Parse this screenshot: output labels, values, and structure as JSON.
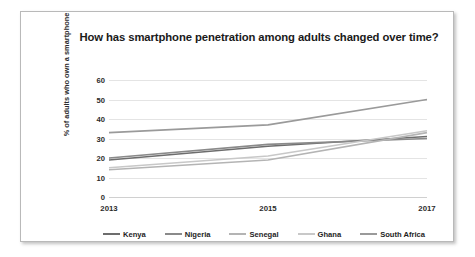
{
  "chart_data": {
    "type": "line",
    "title": "How has smartphone penetration among adults changed over time?",
    "xlabel": "",
    "ylabel": "% of adults who own a smartphone",
    "categories": [
      "2013",
      "2015",
      "2017"
    ],
    "x_tick_labels": [
      "2013",
      "2015",
      "2017"
    ],
    "y_tick_labels": [
      "0",
      "10",
      "20",
      "30",
      "40",
      "50",
      "60"
    ],
    "ylim": [
      0,
      60
    ],
    "y_tick_step": 10,
    "grid": true,
    "legend_position": "bottom",
    "series": [
      {
        "name": "Kenya",
        "values": [
          19,
          26,
          31
        ],
        "color": "#6d6d6d"
      },
      {
        "name": "Nigeria",
        "values": [
          20,
          27,
          30
        ],
        "color": "#8a8a8a"
      },
      {
        "name": "Senegal",
        "values": [
          14,
          19,
          33
        ],
        "color": "#b4b4b4"
      },
      {
        "name": "Ghana",
        "values": [
          15,
          21,
          34
        ],
        "color": "#c8c8c8"
      },
      {
        "name": "South Africa",
        "values": [
          33,
          37,
          50
        ],
        "color": "#9a9a9a"
      }
    ]
  }
}
